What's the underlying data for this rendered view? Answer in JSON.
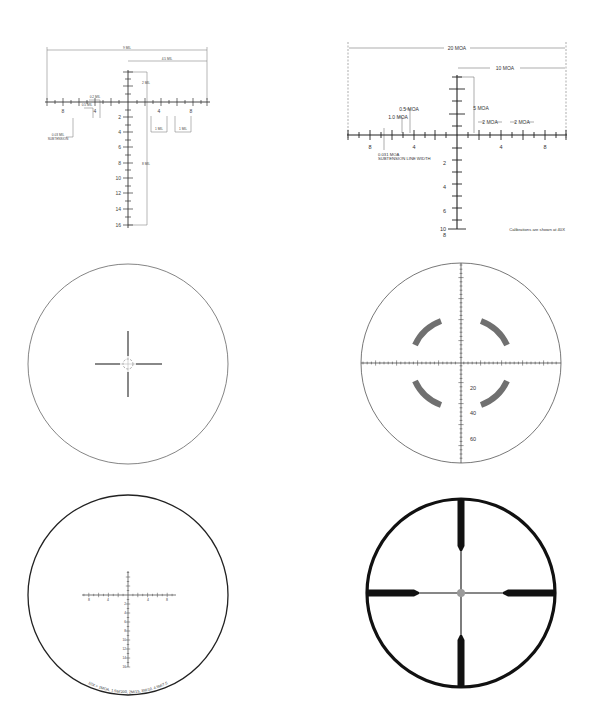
{
  "colors": {
    "line": "#333333",
    "thin_line": "#555555",
    "dim_line": "#888888",
    "arc_fill": "#707070",
    "center_dot": "#9a9a9a",
    "bold_reticle": "#111111"
  },
  "reticles": [
    {
      "id": "mrad-ladder",
      "position": "top-left",
      "dimensions": {
        "overall": "9 MIL",
        "right_half": "4.5 MIL",
        "upper_post": "2 MIL",
        "lower_post": "8 MIL",
        "hash_1": "0.2 MIL",
        "hash_2": "0.5 MIL",
        "gap_1": "1 MIL",
        "gap_2": "1 MIL",
        "line_width": "0.03 MIL",
        "line_width_sub": "SUBTENSION"
      },
      "h_labels": [
        "8",
        "4",
        "4",
        "8"
      ],
      "v_labels": [
        "2",
        "4",
        "6",
        "8",
        "10",
        "12",
        "14",
        "16"
      ]
    },
    {
      "id": "moa-ladder",
      "position": "top-right",
      "dimensions": {
        "overall": "20 MOA",
        "right_half": "10 MOA",
        "upper_post": "5 MOA",
        "hash_half": "0.5 MOA",
        "hash_one": "1.0 MOA",
        "gap_1": "2 MOA",
        "gap_2": "2 MOA",
        "line_width": "0.031 MOA",
        "line_width_sub": "SUBTENSION LINE WIDTH"
      },
      "h_labels": [
        "8",
        "4",
        "4",
        "8"
      ],
      "v_labels": [
        "2",
        "4",
        "6",
        "8",
        "10"
      ],
      "note": "Calibrations are shown at 40X"
    },
    {
      "id": "fine-crosshair-circle",
      "position": "middle-left"
    },
    {
      "id": "arc-milling",
      "position": "middle-right",
      "v_labels": [
        "20",
        "40",
        "60"
      ]
    },
    {
      "id": "ballistic-circle",
      "position": "bottom-left",
      "h_labels": [
        "8",
        "4",
        "4",
        "8"
      ],
      "v_labels": [
        "2",
        "4",
        "6",
        "8",
        "10",
        "12",
        "14",
        "16"
      ],
      "arc_caption": "10X = 1MOA, 1.5M/200, 2M/15, 3M/10, 4.5M/7.5"
    },
    {
      "id": "duplex",
      "position": "bottom-right"
    }
  ]
}
